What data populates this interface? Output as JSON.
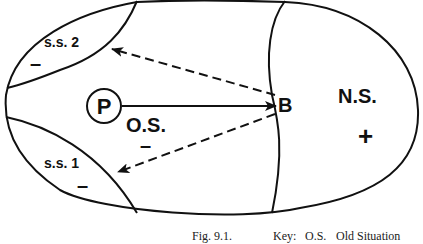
{
  "figure": {
    "caption_number": "Fig. 9.1.",
    "key_label": "Key:",
    "key_entries": [
      {
        "abbr": "O.S.",
        "meaning": "Old Situation"
      }
    ]
  },
  "regions": {
    "ss2": {
      "label": "s.s. 2",
      "sign": "–"
    },
    "ss1": {
      "label": "s.s. 1",
      "sign": "–"
    },
    "os": {
      "label": "O.S.",
      "sign": "–"
    },
    "ns": {
      "label": "N.S.",
      "sign": "+"
    }
  },
  "nodes": {
    "p": {
      "label": "P"
    },
    "b": {
      "label": "B"
    }
  },
  "arrows": [
    {
      "from": "P",
      "to": "B",
      "style": "solid"
    },
    {
      "from": "B",
      "to": "s.s. 2",
      "style": "dashed"
    },
    {
      "from": "B",
      "to": "s.s. 1",
      "style": "dashed"
    }
  ],
  "colors": {
    "stroke": "#111111",
    "background": "#ffffff"
  }
}
